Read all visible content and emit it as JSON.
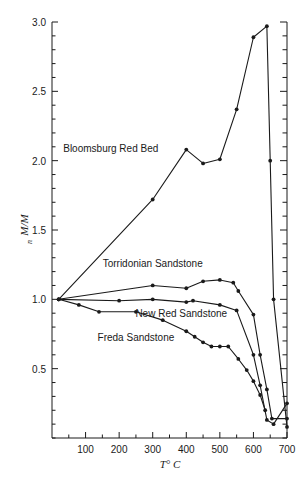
{
  "chart_data": {
    "type": "line",
    "title": "",
    "xlabel": "T° C",
    "ylabel": "M/Mₙ",
    "ylabel_main": "M/M",
    "ylabel_subscript": "n",
    "xlim": [
      0,
      700
    ],
    "ylim": [
      0,
      3.0
    ],
    "grid": false,
    "legend_position": "inline-annotations",
    "x_ticks": [
      100,
      200,
      300,
      400,
      500,
      600,
      700
    ],
    "x_tick_labels": [
      "100",
      "200",
      "300",
      "400",
      "500",
      "600",
      "700"
    ],
    "x_minor_tick_step": 50,
    "y_ticks": [
      0.5,
      1.0,
      1.5,
      2.0,
      2.5,
      3.0
    ],
    "y_tick_labels": [
      "0.5",
      "1.0",
      "1.5",
      "2.0",
      "2.5",
      "3.0"
    ],
    "y_minor_tick_step": 0.1,
    "right_axis_ticks": true,
    "series": [
      {
        "name": "Bloomsburg Red Bed",
        "label_x": 175,
        "label_y": 2.06,
        "x": [
          20,
          300,
          400,
          450,
          500,
          550,
          600,
          640,
          650,
          660,
          700
        ],
        "y": [
          1.0,
          1.72,
          2.08,
          1.98,
          2.01,
          2.37,
          2.89,
          2.97,
          2.0,
          1.0,
          0.08
        ]
      },
      {
        "name": "Torridonian Sandstone",
        "label_x": 300,
        "label_y": 1.23,
        "x": [
          20,
          300,
          400,
          450,
          500,
          540,
          555,
          600,
          620,
          640,
          655,
          700
        ],
        "y": [
          1.0,
          1.1,
          1.08,
          1.13,
          1.14,
          1.12,
          1.06,
          0.89,
          0.6,
          0.35,
          0.14,
          0.14
        ]
      },
      {
        "name": "New Red Sandstone",
        "label_x": 385,
        "label_y": 0.87,
        "x": [
          20,
          200,
          300,
          400,
          420,
          500,
          550,
          600,
          620,
          640,
          660,
          700
        ],
        "y": [
          1.0,
          0.99,
          1.0,
          0.98,
          0.99,
          0.96,
          0.92,
          0.6,
          0.38,
          0.13,
          0.1,
          0.25
        ]
      },
      {
        "name": "Freda Sandstone",
        "label_x": 250,
        "label_y": 0.7,
        "x": [
          20,
          80,
          140,
          250,
          330,
          400,
          425,
          450,
          475,
          500,
          525,
          555,
          580,
          600,
          620,
          635
        ],
        "y": [
          1.0,
          0.96,
          0.91,
          0.91,
          0.85,
          0.77,
          0.73,
          0.69,
          0.66,
          0.66,
          0.66,
          0.57,
          0.49,
          0.41,
          0.31,
          0.2
        ]
      }
    ]
  }
}
